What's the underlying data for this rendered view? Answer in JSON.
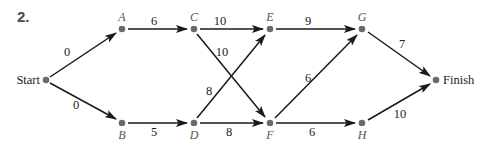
{
  "problem": {
    "number": "2."
  },
  "diagram": {
    "type": "directed-network",
    "nodes": [
      {
        "id": "Start",
        "label": "Start",
        "x": 46,
        "y": 80,
        "label_pos": "left"
      },
      {
        "id": "A",
        "label": "A",
        "x": 122,
        "y": 29,
        "label_pos": "above"
      },
      {
        "id": "B",
        "label": "B",
        "x": 122,
        "y": 123,
        "label_pos": "below"
      },
      {
        "id": "C",
        "label": "C",
        "x": 194,
        "y": 29,
        "label_pos": "above"
      },
      {
        "id": "D",
        "label": "D",
        "x": 194,
        "y": 123,
        "label_pos": "below"
      },
      {
        "id": "E",
        "label": "E",
        "x": 270,
        "y": 29,
        "label_pos": "above"
      },
      {
        "id": "F",
        "label": "F",
        "x": 270,
        "y": 123,
        "label_pos": "below"
      },
      {
        "id": "G",
        "label": "G",
        "x": 362,
        "y": 29,
        "label_pos": "above"
      },
      {
        "id": "H",
        "label": "H",
        "x": 362,
        "y": 123,
        "label_pos": "below"
      },
      {
        "id": "Finish",
        "label": "Finish",
        "x": 436,
        "y": 80,
        "label_pos": "right"
      }
    ],
    "edges": [
      {
        "from": "Start",
        "to": "A",
        "weight": "0"
      },
      {
        "from": "Start",
        "to": "B",
        "weight": "0"
      },
      {
        "from": "A",
        "to": "C",
        "weight": "6"
      },
      {
        "from": "B",
        "to": "D",
        "weight": "5"
      },
      {
        "from": "C",
        "to": "E",
        "weight": "10"
      },
      {
        "from": "C",
        "to": "F",
        "weight": "10"
      },
      {
        "from": "D",
        "to": "E",
        "weight": "8"
      },
      {
        "from": "D",
        "to": "F",
        "weight": "8"
      },
      {
        "from": "E",
        "to": "G",
        "weight": "9"
      },
      {
        "from": "F",
        "to": "G",
        "weight": "6"
      },
      {
        "from": "F",
        "to": "H",
        "weight": "6"
      },
      {
        "from": "G",
        "to": "Finish",
        "weight": "7"
      },
      {
        "from": "H",
        "to": "Finish",
        "weight": "10"
      }
    ]
  }
}
